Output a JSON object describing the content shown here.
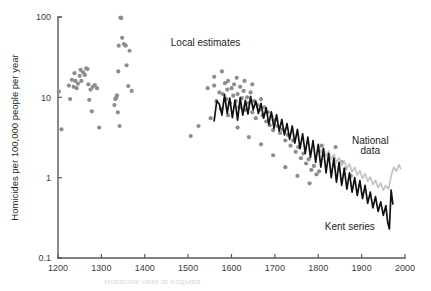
{
  "figure": {
    "background_color": "#ffffff",
    "caption_partial": "Homicide rates in England"
  },
  "chart_data": {
    "type": "scatter",
    "title": "",
    "xlabel": "",
    "ylabel": "Homicides per 100,000 people per year",
    "yscale": "log",
    "ylim": [
      0.1,
      100
    ],
    "xlim": [
      1200,
      2000
    ],
    "grid": false,
    "legend_position": "inline-annotations",
    "x_ticks": [
      1200,
      1300,
      1400,
      1500,
      1600,
      1700,
      1800,
      1900,
      2000
    ],
    "x_tick_labels": [
      "1200",
      "1300",
      "1400",
      "1500",
      "1600",
      "1700",
      "1800",
      "1900",
      "2000"
    ],
    "y_ticks": [
      0.1,
      1,
      10,
      100
    ],
    "y_tick_labels": [
      "0.1",
      "1",
      "10",
      "100"
    ],
    "annotations": [
      {
        "text": "Local estimates",
        "x": 1460,
        "y": 44.0,
        "name": "local-estimates-label"
      },
      {
        "text": "National",
        "x": 1920,
        "y": 2.6,
        "name": "national-data-label-line1"
      },
      {
        "text": "data",
        "x": 1920,
        "y": 1.95,
        "name": "national-data-label-line2"
      },
      {
        "text": "Kent series",
        "x": 1815,
        "y": 0.225,
        "name": "kent-series-label"
      }
    ],
    "series": [
      {
        "name": "Local estimates",
        "type": "scatter",
        "color": "#8d8d8d",
        "marker": "circle",
        "points": [
          [
            1202,
            11.8
          ],
          [
            1208,
            4.0
          ],
          [
            1225,
            14.0
          ],
          [
            1228,
            9.5
          ],
          [
            1232,
            16.5
          ],
          [
            1236,
            13.5
          ],
          [
            1238,
            20.0
          ],
          [
            1240,
            16.0
          ],
          [
            1243,
            13.0
          ],
          [
            1246,
            14.8
          ],
          [
            1250,
            18.5
          ],
          [
            1252,
            22.0
          ],
          [
            1254,
            16.0
          ],
          [
            1258,
            20.5
          ],
          [
            1262,
            19.0
          ],
          [
            1265,
            23.0
          ],
          [
            1268,
            22.5
          ],
          [
            1270,
            14.5
          ],
          [
            1272,
            9.3
          ],
          [
            1275,
            12.5
          ],
          [
            1278,
            6.7
          ],
          [
            1280,
            13.5
          ],
          [
            1285,
            14.2
          ],
          [
            1290,
            13.0
          ],
          [
            1295,
            4.2
          ],
          [
            1330,
            8.0
          ],
          [
            1332,
            9.5
          ],
          [
            1334,
            9.8
          ],
          [
            1335,
            10.2
          ],
          [
            1336,
            10.6
          ],
          [
            1338,
            6.5
          ],
          [
            1339,
            21.0
          ],
          [
            1340,
            44.0
          ],
          [
            1342,
            4.4
          ],
          [
            1344,
            98.0
          ],
          [
            1346,
            97.0
          ],
          [
            1348,
            55.0
          ],
          [
            1352,
            46.0
          ],
          [
            1356,
            44.0
          ],
          [
            1358,
            25.0
          ],
          [
            1362,
            13.8
          ],
          [
            1365,
            38.0
          ],
          [
            1370,
            12.0
          ],
          [
            1545,
            13.0
          ],
          [
            1552,
            5.5
          ],
          [
            1560,
            14.0
          ],
          [
            1565,
            9.0
          ],
          [
            1572,
            11.5
          ],
          [
            1578,
            21.0
          ],
          [
            1580,
            11.0
          ],
          [
            1585,
            15.0
          ],
          [
            1588,
            9.5
          ],
          [
            1590,
            12.5
          ],
          [
            1592,
            16.0
          ],
          [
            1596,
            8.5
          ],
          [
            1600,
            13.0
          ],
          [
            1604,
            10.5
          ],
          [
            1606,
            14.5
          ],
          [
            1610,
            9.0
          ],
          [
            1614,
            11.0
          ],
          [
            1618,
            7.5
          ],
          [
            1620,
            13.5
          ],
          [
            1624,
            9.8
          ],
          [
            1628,
            12.0
          ],
          [
            1632,
            7.0
          ],
          [
            1636,
            10.0
          ],
          [
            1640,
            8.5
          ],
          [
            1644,
            11.5
          ],
          [
            1648,
            6.5
          ],
          [
            1652,
            9.0
          ],
          [
            1656,
            5.5
          ],
          [
            1660,
            8.0
          ],
          [
            1664,
            7.0
          ],
          [
            1668,
            9.5
          ],
          [
            1672,
            6.0
          ],
          [
            1676,
            7.5
          ],
          [
            1680,
            5.0
          ],
          [
            1684,
            6.5
          ],
          [
            1688,
            4.5
          ],
          [
            1692,
            5.8
          ],
          [
            1696,
            3.9
          ],
          [
            1700,
            5.2
          ],
          [
            1706,
            4.4
          ],
          [
            1712,
            3.6
          ],
          [
            1718,
            4.0
          ],
          [
            1724,
            2.9
          ],
          [
            1730,
            3.4
          ],
          [
            1736,
            2.5
          ],
          [
            1742,
            2.9
          ],
          [
            1748,
            2.1
          ],
          [
            1754,
            2.4
          ],
          [
            1760,
            1.75
          ],
          [
            1766,
            2.0
          ],
          [
            1772,
            1.5
          ],
          [
            1778,
            1.7
          ],
          [
            1784,
            1.25
          ],
          [
            1790,
            1.4
          ],
          [
            1796,
            1.1
          ],
          [
            1802,
            1.2
          ],
          [
            1808,
            2.5
          ],
          [
            1614,
            4.2
          ],
          [
            1640,
            3.2
          ],
          [
            1668,
            2.6
          ],
          [
            1696,
            1.9
          ],
          [
            1724,
            1.35
          ],
          [
            1752,
            1.05
          ],
          [
            1780,
            0.85
          ],
          [
            1592,
            6.0
          ],
          [
            1630,
            16.0
          ],
          [
            1560,
            18.0
          ],
          [
            1575,
            7.2
          ],
          [
            1648,
            14.5
          ],
          [
            1612,
            17.5
          ],
          [
            1524,
            4.4
          ],
          [
            1506,
            3.3
          ],
          [
            1840,
            2.4
          ],
          [
            1855,
            1.55
          ],
          [
            1862,
            1.3
          ],
          [
            1875,
            1.05
          ]
        ]
      },
      {
        "name": "Kent series",
        "type": "line",
        "color": "#111111",
        "points": [
          [
            1560,
            5.1
          ],
          [
            1566,
            9.0
          ],
          [
            1572,
            8.2
          ],
          [
            1578,
            6.0
          ],
          [
            1584,
            10.8
          ],
          [
            1590,
            6.3
          ],
          [
            1596,
            9.8
          ],
          [
            1602,
            5.6
          ],
          [
            1608,
            9.2
          ],
          [
            1614,
            5.2
          ],
          [
            1620,
            9.9
          ],
          [
            1626,
            6.0
          ],
          [
            1632,
            9.2
          ],
          [
            1638,
            6.2
          ],
          [
            1644,
            10.3
          ],
          [
            1650,
            7.0
          ],
          [
            1656,
            9.0
          ],
          [
            1662,
            6.3
          ],
          [
            1668,
            8.4
          ],
          [
            1674,
            5.5
          ],
          [
            1680,
            7.4
          ],
          [
            1686,
            4.6
          ],
          [
            1692,
            6.6
          ],
          [
            1698,
            4.1
          ],
          [
            1704,
            6.1
          ],
          [
            1710,
            3.8
          ],
          [
            1716,
            5.3
          ],
          [
            1722,
            3.4
          ],
          [
            1728,
            4.7
          ],
          [
            1734,
            3.0
          ],
          [
            1740,
            4.4
          ],
          [
            1746,
            2.7
          ],
          [
            1752,
            4.0
          ],
          [
            1758,
            2.3
          ],
          [
            1764,
            3.5
          ],
          [
            1770,
            2.0
          ],
          [
            1776,
            3.2
          ],
          [
            1782,
            1.8
          ],
          [
            1788,
            2.9
          ],
          [
            1794,
            1.55
          ],
          [
            1800,
            2.6
          ],
          [
            1806,
            1.35
          ],
          [
            1812,
            2.3
          ],
          [
            1818,
            1.15
          ],
          [
            1824,
            2.0
          ],
          [
            1830,
            1.0
          ],
          [
            1836,
            1.75
          ],
          [
            1842,
            0.88
          ],
          [
            1848,
            1.55
          ],
          [
            1854,
            0.8
          ],
          [
            1860,
            1.3
          ],
          [
            1866,
            0.72
          ],
          [
            1872,
            1.15
          ],
          [
            1878,
            0.66
          ],
          [
            1884,
            1.0
          ],
          [
            1890,
            0.6
          ],
          [
            1896,
            0.92
          ],
          [
            1902,
            0.55
          ],
          [
            1908,
            0.8
          ],
          [
            1914,
            0.48
          ],
          [
            1920,
            0.66
          ],
          [
            1926,
            0.42
          ],
          [
            1932,
            0.58
          ],
          [
            1938,
            0.38
          ],
          [
            1944,
            0.5
          ],
          [
            1950,
            0.34
          ],
          [
            1956,
            0.45
          ],
          [
            1960,
            0.28
          ],
          [
            1964,
            0.23
          ],
          [
            1968,
            0.7
          ],
          [
            1972,
            0.47
          ]
        ]
      },
      {
        "name": "National data",
        "type": "line",
        "color": "#c3c3c3",
        "points": [
          [
            1800,
            2.55
          ],
          [
            1806,
            2.05
          ],
          [
            1812,
            2.35
          ],
          [
            1818,
            1.85
          ],
          [
            1824,
            2.15
          ],
          [
            1830,
            1.7
          ],
          [
            1836,
            1.95
          ],
          [
            1842,
            1.55
          ],
          [
            1848,
            1.78
          ],
          [
            1854,
            1.42
          ],
          [
            1860,
            1.62
          ],
          [
            1866,
            1.3
          ],
          [
            1872,
            1.48
          ],
          [
            1878,
            1.18
          ],
          [
            1884,
            1.35
          ],
          [
            1890,
            1.08
          ],
          [
            1896,
            1.22
          ],
          [
            1902,
            0.98
          ],
          [
            1908,
            1.12
          ],
          [
            1914,
            0.9
          ],
          [
            1920,
            1.02
          ],
          [
            1926,
            0.82
          ],
          [
            1932,
            0.93
          ],
          [
            1938,
            0.75
          ],
          [
            1944,
            0.86
          ],
          [
            1950,
            0.7
          ],
          [
            1956,
            0.8
          ],
          [
            1962,
            0.72
          ],
          [
            1968,
            1.05
          ],
          [
            1974,
            1.35
          ],
          [
            1980,
            1.2
          ],
          [
            1986,
            1.45
          ],
          [
            1990,
            1.3
          ]
        ]
      }
    ]
  }
}
